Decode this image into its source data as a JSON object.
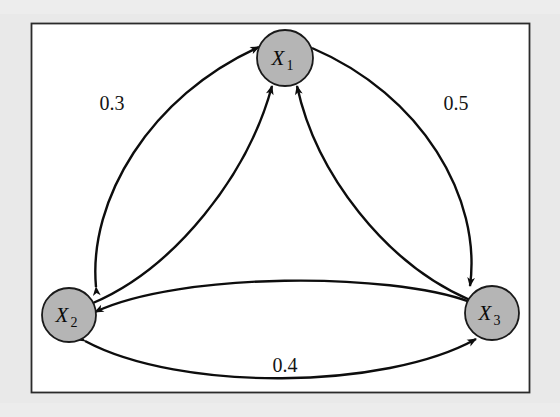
{
  "figure": {
    "kind": "directed-weighted-graph",
    "background_color": "#e9e9e9",
    "panel": {
      "fill": "#ffffff",
      "border_color": "#2b2b2b",
      "x": 31,
      "y": 23,
      "width": 499,
      "height": 370
    },
    "node_style": {
      "fill": "#b5b5b5",
      "stroke": "#1a1a1a",
      "radius": 27
    },
    "edge_style": {
      "stroke": "#0d0d0d",
      "width": 2.4
    }
  },
  "nodes": [
    {
      "id": "X1",
      "base": "X",
      "subscript": "1",
      "cx": 285,
      "cy": 58,
      "r": 28
    },
    {
      "id": "X2",
      "base": "X",
      "subscript": "2",
      "cx": 69,
      "cy": 315,
      "r": 27
    },
    {
      "id": "X3",
      "base": "X",
      "subscript": "3",
      "cx": 492,
      "cy": 313,
      "r": 27
    }
  ],
  "edges": [
    {
      "id": "e-x2-x1-outer",
      "from": "X2",
      "to": "X1",
      "bidirectional": true,
      "weight": "0.3",
      "label_x": 112,
      "label_y": 110,
      "side": "left-outer"
    },
    {
      "id": "e-x1-x3-outer",
      "from": "X1",
      "to": "X3",
      "bidirectional": true,
      "weight": "0.5",
      "label_x": 456,
      "label_y": 110,
      "side": "right-outer"
    },
    {
      "id": "e-x2-x3-outer",
      "from": "X2",
      "to": "X3",
      "bidirectional": true,
      "weight": "0.4",
      "label_x": 285,
      "label_y": 372,
      "side": "bottom-outer"
    },
    {
      "id": "e-x2-x1-inner",
      "from": "X2",
      "to": "X1",
      "bidirectional": false,
      "weight": "",
      "label_x": null,
      "label_y": null,
      "side": "left-inner"
    },
    {
      "id": "e-x3-x1-inner",
      "from": "X3",
      "to": "X1",
      "bidirectional": false,
      "weight": "",
      "label_x": null,
      "label_y": null,
      "side": "right-inner"
    },
    {
      "id": "e-x3-x2-inner",
      "from": "X3",
      "to": "X2",
      "bidirectional": false,
      "weight": "",
      "label_x": null,
      "label_y": null,
      "side": "bottom-inner"
    }
  ],
  "weights": {
    "x1_x2": "0.3",
    "x1_x3": "0.5",
    "x2_x3": "0.4"
  }
}
